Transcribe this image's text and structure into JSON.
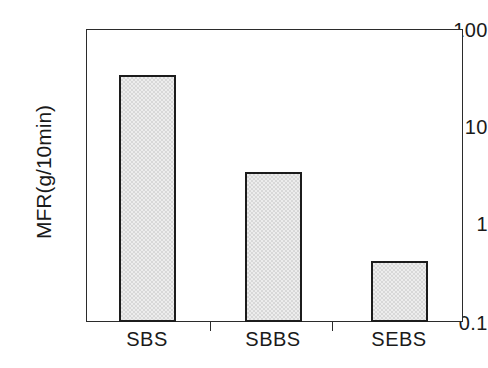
{
  "chart_data": {
    "type": "bar",
    "title": "",
    "subtitle": "",
    "xlabel": "",
    "ylabel": "MFR(g/10min)",
    "categories": [
      "SBS",
      "SBBS",
      "SEBS"
    ],
    "values": [
      34,
      3.4,
      0.42
    ],
    "series": [
      {
        "name": "MFR",
        "values": [
          34,
          3.4,
          0.42
        ]
      }
    ],
    "yscale": "log",
    "ylim": [
      0.1,
      100
    ],
    "ytick_labels": [
      "100",
      "10",
      "1",
      "0.1"
    ],
    "ytick_values": [
      100,
      10,
      1,
      0.1
    ],
    "xtick_labels": [
      "SBS",
      "SBBS",
      "SEBS"
    ],
    "grid": false,
    "legend": false,
    "legend_position": "none",
    "annotations": [],
    "colors": {
      "bar_fill": "#ededed",
      "bar_edge": "#1c1c1c",
      "axis": "#2b2b2b",
      "text": "#1a1a1a",
      "background": "#ffffff"
    }
  },
  "axes": {
    "y_title": "MFR(g/10min)",
    "y_ticks": [
      {
        "label": "100",
        "value": 100
      },
      {
        "label": "10",
        "value": 10
      },
      {
        "label": "1",
        "value": 1
      },
      {
        "label": "0.1",
        "value": 0.1
      }
    ],
    "x_ticks": [
      {
        "label": "SBS"
      },
      {
        "label": "SBBS"
      },
      {
        "label": "SEBS"
      }
    ]
  }
}
